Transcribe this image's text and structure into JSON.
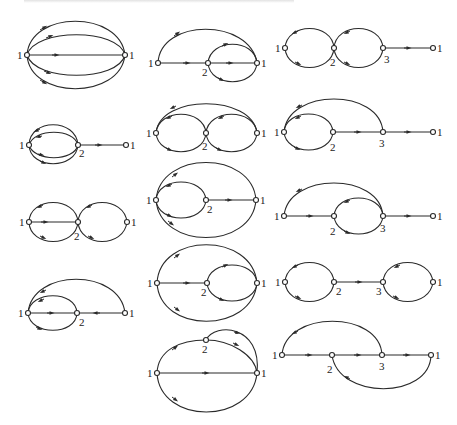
{
  "figure": {
    "node_label_font_size": 11,
    "colors": {
      "stroke": "#2a2a2a",
      "background": "#ffffff",
      "text": "#222222"
    }
  },
  "diagrams": [
    {
      "id": "a1",
      "labels": [
        "1",
        "1"
      ]
    },
    {
      "id": "a2",
      "labels": [
        "1",
        "2",
        "1"
      ]
    },
    {
      "id": "a3",
      "labels": [
        "1",
        "2",
        "1"
      ]
    },
    {
      "id": "a4",
      "labels": [
        "1",
        "2",
        "1"
      ]
    },
    {
      "id": "b1",
      "labels": [
        "1",
        "2",
        "1"
      ]
    },
    {
      "id": "b2",
      "labels": [
        "1",
        "2",
        "1"
      ]
    },
    {
      "id": "b3",
      "labels": [
        "1",
        "2",
        "1"
      ]
    },
    {
      "id": "b4",
      "labels": [
        "1",
        "2",
        "1"
      ]
    },
    {
      "id": "b5",
      "labels": [
        "1",
        "2",
        "1"
      ]
    },
    {
      "id": "c1",
      "labels": [
        "1",
        "2",
        "3",
        "1"
      ]
    },
    {
      "id": "c2",
      "labels": [
        "1",
        "2",
        "3",
        "1"
      ]
    },
    {
      "id": "c3",
      "labels": [
        "1",
        "2",
        "3",
        "1"
      ]
    },
    {
      "id": "c4",
      "labels": [
        "1",
        "2",
        "3",
        "1"
      ]
    },
    {
      "id": "c5",
      "labels": [
        "1",
        "2",
        "3",
        "1"
      ]
    }
  ]
}
